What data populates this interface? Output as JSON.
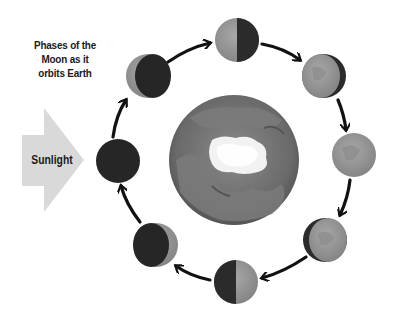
{
  "title": {
    "lines": [
      "Phases of the",
      "Moon as it",
      "orbits Earth"
    ]
  },
  "sunlight": {
    "label": "Sunlight",
    "color": "#d9d9d9"
  },
  "earth": {
    "label": "Earth",
    "ocean_color": "#6e6e6e",
    "land_color": "#8c8c8c",
    "ice_color": "#f2f2f2"
  },
  "moon_phases": [
    {
      "name": "New Moon",
      "icon": "new-moon-icon"
    },
    {
      "name": "Waxing Crescent",
      "icon": "waxing-crescent-icon"
    },
    {
      "name": "First Quarter",
      "icon": "first-quarter-icon"
    },
    {
      "name": "Waxing Gibbous",
      "icon": "waxing-gibbous-icon"
    },
    {
      "name": "Full Moon",
      "icon": "full-moon-icon"
    },
    {
      "name": "Waning Gibbous",
      "icon": "waning-gibbous-icon"
    },
    {
      "name": "Last Quarter",
      "icon": "last-quarter-icon"
    },
    {
      "name": "Waning Crescent",
      "icon": "waning-crescent-icon"
    }
  ],
  "colors": {
    "dark_side": "#2b2b2b",
    "lit_side": "#9a9a9a",
    "arrow": "#111111"
  }
}
